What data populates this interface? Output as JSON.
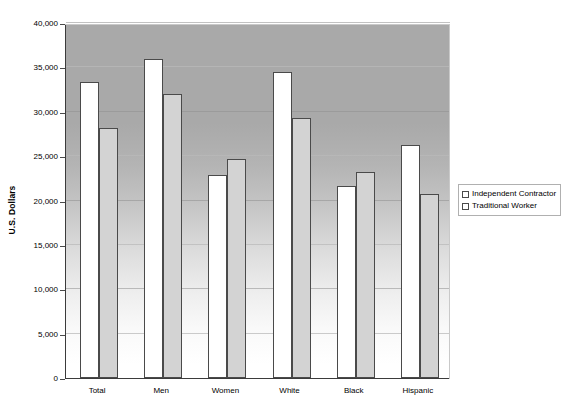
{
  "chart_data": {
    "type": "bar",
    "title": "",
    "subtitle": "",
    "xlabel": "",
    "ylabel": "U.S. Dollars",
    "categories": [
      "Total",
      "Men",
      "Women",
      "White",
      "Black",
      "Hispanic"
    ],
    "series": [
      {
        "name": "Independent Contractor",
        "color": "#ffffff",
        "values": [
          33300,
          36000,
          22900,
          34500,
          21600,
          26200
        ]
      },
      {
        "name": "Traditional Worker",
        "color": "#d3d3d3",
        "values": [
          28200,
          32000,
          24700,
          29300,
          23200,
          20700
        ]
      }
    ],
    "ylim": [
      0,
      40000
    ],
    "ytick_step": 5000,
    "ytick_labels": [
      "0",
      "5,000",
      "10,000",
      "15,000",
      "20,000",
      "25,000",
      "30,000",
      "35,000",
      "40,000"
    ],
    "ytick_values": [
      0,
      5000,
      10000,
      15000,
      20000,
      25000,
      30000,
      35000,
      40000
    ],
    "grid": true,
    "grid_axis": "y",
    "legend_position": "right",
    "plot_background": "vertical-gradient-gray-to-white"
  },
  "legend": {
    "items": [
      {
        "label": "Independent Contractor",
        "marker": "square-outline"
      },
      {
        "label": "Traditional Worker",
        "marker": "square-outline"
      }
    ]
  }
}
